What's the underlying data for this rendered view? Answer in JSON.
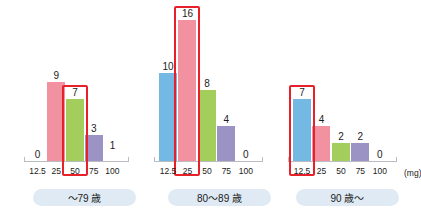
{
  "chart_data": {
    "type": "bar",
    "title": "",
    "xlabel": "(mg)",
    "ylabel": "",
    "categories": [
      "12.5",
      "25",
      "50",
      "75",
      "100"
    ],
    "ylim": [
      0,
      17
    ],
    "grid": false,
    "legend": "none",
    "colors": {
      "12.5": "#74b8e4",
      "25": "#f2919f",
      "50": "#a3ce5c",
      "75": "#9b93c4",
      "highlight": "#e8202a",
      "axis": "#b9bcc0",
      "panel_label_bg": "#dfeaf4",
      "text": "#1b1b1b"
    },
    "panels": [
      {
        "label": "～79 歳",
        "values": [
          0,
          9,
          7,
          3,
          1
        ],
        "highlight_category": "50",
        "highlight_value": 7
      },
      {
        "label": "80～89 歳",
        "values": [
          10,
          16,
          8,
          4,
          0
        ],
        "highlight_category": "25",
        "highlight_value": 16
      },
      {
        "label": "90 歳～",
        "values": [
          7,
          4,
          2,
          2,
          0
        ],
        "highlight_category": "12.5",
        "highlight_value": 7
      }
    ]
  }
}
